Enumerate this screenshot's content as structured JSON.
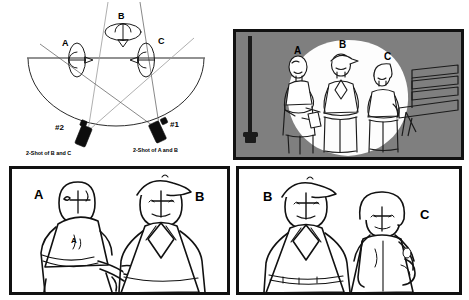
{
  "document": {
    "title": "180-Degree Rule Storyboard",
    "background_color": "#ffffff"
  },
  "diagram": {
    "name": "overhead-camera-placement-diagram",
    "subject_labels": {
      "a": "A",
      "b": "B",
      "c": "C"
    },
    "cameras": [
      {
        "id": "camera-2",
        "number": "#2",
        "caption": "2-Shot of B and C"
      },
      {
        "id": "camera-1",
        "number": "#1",
        "caption": "2-Shot of A and B"
      }
    ],
    "line_of_action_color": "#6e6e6e",
    "arc_color": "#2b2b2b",
    "sightline_color": "#9a9a9a"
  },
  "frames": [
    {
      "id": "frame-wide-shot",
      "name": "wide-establishing-shot",
      "background_color": "#7f7f7f",
      "spotlight_color": "#fdfdfd",
      "labels": [
        "A",
        "B",
        "C"
      ],
      "props": [
        "lamppost",
        "park-bench"
      ],
      "figure_count": 3
    },
    {
      "id": "frame-two-shot-ab",
      "name": "two-shot-a-and-b",
      "background_color": "#ffffff",
      "labels": [
        "A",
        "B"
      ],
      "figure_count": 2,
      "note_letter": "A"
    },
    {
      "id": "frame-two-shot-bc",
      "name": "two-shot-b-and-c",
      "background_color": "#ffffff",
      "labels": [
        "B",
        "C"
      ],
      "figure_count": 2
    }
  ]
}
